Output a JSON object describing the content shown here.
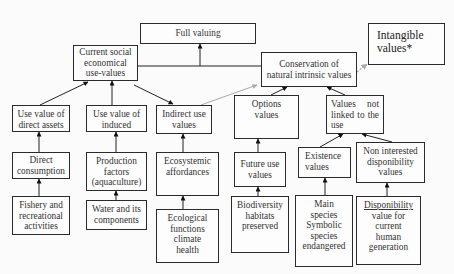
{
  "diagram": {
    "nodes": {
      "full_valuing": "Full valuing",
      "current_social": "Current social\neconomical\nuse-values",
      "conservation": "Conservation of\nnatural intrinsic values",
      "intangible": "Intangible\nvalues*",
      "use_value_direct": "Use value of\ndirect assets",
      "use_value_induced": "Use value of\ninduced",
      "indirect_use": "Indirect use\nvalues",
      "options_values": "Options\nvalues",
      "values_not_linked": "Values not linked to the use",
      "direct_consumption": "Direct\nconsumption",
      "production_factors": "Production\nfactors\n(aquaculture)",
      "ecosystemic": "Ecosystemic\naffordances",
      "future_use": "Future use\nvalues",
      "existence": "Existence\nvalues",
      "non_interested": "Non interested\ndisponibility\nvalues",
      "fishery": "Fishery and\nrecreational\nactivities",
      "water": "Water and its\ncomponents",
      "ecological": "Ecological\nfunctions\nclimate\nhealth",
      "biodiversity": "Biodiversity\nhabitats\npreserved",
      "main_species": "Main\nspecies\nSymbolic\nspecies\nendangered",
      "disponibility": "Disponibility\nvalue for\ncurrent\nhuman\ngeneration"
    },
    "edges": [
      {
        "from": "use_value_direct",
        "to": "current_social",
        "style": "solid"
      },
      {
        "from": "use_value_induced",
        "to": "current_social",
        "style": "solid"
      },
      {
        "from": "current_social",
        "to": "indirect_use",
        "style": "solid"
      },
      {
        "from": "current_social",
        "to": "full_valuing",
        "style": "solid"
      },
      {
        "from": "conservation",
        "to": "full_valuing",
        "style": "solid"
      },
      {
        "from": "indirect_use",
        "to": "conservation",
        "style": "gray"
      },
      {
        "from": "conservation",
        "to": "intangible",
        "style": "gray-dashed"
      },
      {
        "from": "options_values",
        "to": "conservation",
        "style": "solid"
      },
      {
        "from": "values_not_linked",
        "to": "conservation",
        "style": "solid"
      },
      {
        "from": "direct_consumption",
        "to": "use_value_direct",
        "style": "solid"
      },
      {
        "from": "production_factors",
        "to": "use_value_induced",
        "style": "solid"
      },
      {
        "from": "ecosystemic",
        "to": "indirect_use",
        "style": "solid"
      },
      {
        "from": "future_use",
        "to": "options_values",
        "style": "solid"
      },
      {
        "from": "existence",
        "to": "values_not_linked",
        "style": "solid"
      },
      {
        "from": "non_interested",
        "to": "values_not_linked",
        "style": "solid"
      },
      {
        "from": "fishery",
        "to": "direct_consumption",
        "style": "solid"
      },
      {
        "from": "water",
        "to": "production_factors",
        "style": "solid"
      },
      {
        "from": "ecological",
        "to": "ecosystemic",
        "style": "solid"
      },
      {
        "from": "biodiversity",
        "to": "future_use",
        "style": "solid"
      },
      {
        "from": "main_species",
        "to": "existence",
        "style": "solid"
      },
      {
        "from": "disponibility",
        "to": "non_interested",
        "style": "solid"
      }
    ],
    "colors": {
      "stroke": "#2a2a2a",
      "gray_arrow": "#a9a9a9",
      "background": "#fbfbfb"
    }
  }
}
